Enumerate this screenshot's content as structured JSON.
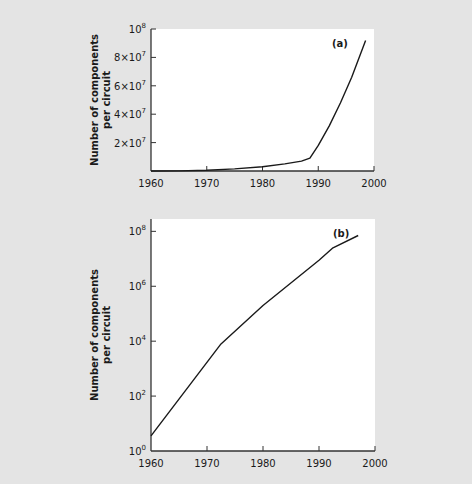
{
  "colors": {
    "background": "#e4e4e4",
    "plot_background": "#ffffff",
    "line": "#1a1a1a",
    "axis": "#333333"
  },
  "chart_data": [
    {
      "id": "a",
      "type": "line",
      "panel_label": "(a)",
      "title": "",
      "xlabel": "",
      "ylabel": "Number of components per circuit",
      "ylabel_lines": [
        "Number of components",
        "per circuit"
      ],
      "yscale": "linear",
      "xlim": [
        1960,
        2000
      ],
      "ylim": [
        0,
        100000000
      ],
      "x_ticks": [
        1960,
        1970,
        1980,
        1990,
        2000
      ],
      "x_tick_labels": [
        "1960",
        "1970",
        "1980",
        "1990",
        "2000"
      ],
      "y_ticks": [
        20000000,
        40000000,
        60000000,
        80000000,
        100000000
      ],
      "y_tick_labels": [
        {
          "base": "2×10",
          "exp": "7"
        },
        {
          "base": "4×10",
          "exp": "7"
        },
        {
          "base": "6×10",
          "exp": "7"
        },
        {
          "base": "8×10",
          "exp": "7"
        },
        {
          "base": "10",
          "exp": "8"
        }
      ],
      "grid": false,
      "legend": null,
      "series": [
        {
          "name": "components",
          "x": [
            1960,
            1965,
            1970,
            1975,
            1980,
            1984,
            1987,
            1988.5,
            1990,
            1992,
            1994,
            1996,
            1998.5
          ],
          "y": [
            0,
            100000,
            500000,
            1500000,
            3000000,
            5000000,
            7000000,
            9000000,
            18000000,
            32000000,
            48000000,
            66000000,
            92000000
          ]
        }
      ],
      "frame_px": {
        "left": 151,
        "top": 29,
        "right": 374,
        "bottom": 171
      }
    },
    {
      "id": "b",
      "type": "line",
      "panel_label": "(b)",
      "title": "",
      "xlabel": "",
      "ylabel": "Number of components per circuit",
      "ylabel_lines": [
        "Number of components",
        "per circuit"
      ],
      "yscale": "log",
      "xlim": [
        1960,
        2000
      ],
      "ylim": [
        1,
        10000000000
      ],
      "log_ylim_exp": [
        0,
        9
      ],
      "x_ticks": [
        1960,
        1970,
        1980,
        1990,
        2000
      ],
      "x_tick_labels": [
        "1960",
        "1970",
        "1980",
        "1990",
        "2000"
      ],
      "y_ticks_exp": [
        0,
        2,
        4,
        6,
        8
      ],
      "y_tick_labels": [
        {
          "base": "10",
          "exp": "0"
        },
        {
          "base": "10",
          "exp": "2"
        },
        {
          "base": "10",
          "exp": "4"
        },
        {
          "base": "10",
          "exp": "6"
        },
        {
          "base": "10",
          "exp": "8"
        }
      ],
      "grid": false,
      "legend": null,
      "series": [
        {
          "name": "components",
          "x": [
            1960,
            1972.5,
            1980,
            1990,
            1992.5,
            1997
          ],
          "y_exp": [
            0.55,
            3.9,
            5.3,
            6.95,
            7.4,
            7.85
          ]
        }
      ],
      "frame_px": {
        "left": 151,
        "top": 219,
        "right": 375,
        "bottom": 451
      }
    }
  ]
}
